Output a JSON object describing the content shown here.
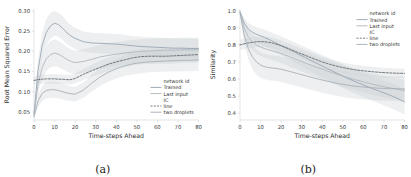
{
  "figure": {
    "panels": [
      {
        "caption": "(a)",
        "name": "panel-a",
        "chart_key": "rmse"
      },
      {
        "caption": "(b)",
        "name": "panel-b",
        "chart_key": "similarity"
      }
    ]
  },
  "legend": {
    "title": "network id",
    "items": [
      {
        "label": "Trained",
        "style": "solid",
        "color": "#9aa7b4"
      },
      {
        "label": "Last input",
        "style": "solid",
        "color": "#b0b8c0"
      },
      {
        "label": "IC",
        "style": "none",
        "color": "#b8bec4"
      },
      {
        "label": "line",
        "style": "dashed",
        "color": "#6f7478"
      },
      {
        "label": "two droplets",
        "style": "solid",
        "color": "#a8b0b8"
      }
    ]
  },
  "colors": {
    "band": "#c9cdd2",
    "band_light": "#dcdfe2",
    "axis": "#d8d8d8",
    "text": "#2f2f2f",
    "background": "#ffffff"
  },
  "chart_data": [
    {
      "key": "rmse",
      "type": "line",
      "title": "",
      "xlabel": "Time-steps Ahead",
      "ylabel": "Root Mean Squared Error",
      "xlim": [
        0,
        80
      ],
      "ylim": [
        0.03,
        0.305
      ],
      "xticks": [
        0,
        10,
        20,
        30,
        40,
        50,
        60,
        70,
        80
      ],
      "yticks": [
        0.05,
        0.1,
        0.15,
        0.2,
        0.25,
        0.3
      ],
      "ytick_labels": [
        "0.05",
        "0.10",
        "0.15",
        "0.20",
        "0.25",
        "0.30"
      ],
      "xtick_labels": [
        "0",
        "10",
        "20",
        "30",
        "40",
        "50",
        "60",
        "70",
        "80"
      ],
      "grid": false,
      "legend_position": "lower-right",
      "x": [
        0,
        2,
        4,
        6,
        8,
        10,
        12,
        14,
        16,
        18,
        20,
        24,
        28,
        32,
        36,
        40,
        44,
        48,
        52,
        56,
        60,
        64,
        68,
        72,
        76,
        80
      ],
      "series": [
        {
          "name": "Trained",
          "style": "solid",
          "values": [
            0.045,
            0.155,
            0.215,
            0.247,
            0.263,
            0.27,
            0.266,
            0.257,
            0.246,
            0.238,
            0.232,
            0.224,
            0.221,
            0.22,
            0.219,
            0.218,
            0.216,
            0.214,
            0.212,
            0.211,
            0.21,
            0.209,
            0.208,
            0.208,
            0.207,
            0.207
          ],
          "band_lower": [
            0.04,
            0.13,
            0.185,
            0.215,
            0.232,
            0.239,
            0.236,
            0.228,
            0.219,
            0.212,
            0.206,
            0.199,
            0.196,
            0.195,
            0.194,
            0.193,
            0.192,
            0.19,
            0.188,
            0.187,
            0.186,
            0.185,
            0.185,
            0.184,
            0.184,
            0.184
          ],
          "band_upper": [
            0.05,
            0.182,
            0.246,
            0.281,
            0.295,
            0.3,
            0.296,
            0.287,
            0.274,
            0.265,
            0.258,
            0.249,
            0.246,
            0.245,
            0.244,
            0.243,
            0.241,
            0.238,
            0.236,
            0.235,
            0.234,
            0.233,
            0.232,
            0.232,
            0.231,
            0.231
          ]
        },
        {
          "name": "Last input",
          "style": "solid",
          "values": [
            0.042,
            0.12,
            0.16,
            0.182,
            0.192,
            0.196,
            0.193,
            0.187,
            0.18,
            0.175,
            0.172,
            0.175,
            0.18,
            0.186,
            0.19,
            0.193,
            0.196,
            0.198,
            0.2,
            0.201,
            0.202,
            0.203,
            0.203,
            0.204,
            0.204,
            0.204
          ],
          "band_lower": [
            0.037,
            0.098,
            0.132,
            0.151,
            0.16,
            0.163,
            0.161,
            0.156,
            0.15,
            0.146,
            0.143,
            0.146,
            0.151,
            0.157,
            0.161,
            0.164,
            0.167,
            0.169,
            0.171,
            0.172,
            0.173,
            0.174,
            0.174,
            0.175,
            0.175,
            0.175
          ],
          "band_upper": [
            0.047,
            0.143,
            0.189,
            0.214,
            0.225,
            0.23,
            0.226,
            0.219,
            0.211,
            0.205,
            0.202,
            0.205,
            0.21,
            0.216,
            0.22,
            0.223,
            0.226,
            0.228,
            0.23,
            0.231,
            0.232,
            0.233,
            0.233,
            0.234,
            0.234,
            0.234
          ]
        },
        {
          "name": "line",
          "style": "dashed",
          "values": [
            0.128,
            0.13,
            0.131,
            0.132,
            0.132,
            0.132,
            0.131,
            0.131,
            0.13,
            0.13,
            0.133,
            0.143,
            0.152,
            0.16,
            0.168,
            0.174,
            0.179,
            0.184,
            0.187,
            0.188,
            0.188,
            0.188,
            0.189,
            0.19,
            0.191,
            0.192
          ],
          "band_lower": [
            0.118,
            0.119,
            0.12,
            0.12,
            0.12,
            0.12,
            0.119,
            0.119,
            0.118,
            0.118,
            0.121,
            0.129,
            0.137,
            0.144,
            0.151,
            0.157,
            0.161,
            0.165,
            0.168,
            0.169,
            0.169,
            0.169,
            0.17,
            0.171,
            0.172,
            0.173
          ],
          "band_upper": [
            0.138,
            0.141,
            0.142,
            0.143,
            0.144,
            0.144,
            0.143,
            0.143,
            0.142,
            0.142,
            0.145,
            0.157,
            0.167,
            0.176,
            0.185,
            0.191,
            0.197,
            0.203,
            0.206,
            0.207,
            0.207,
            0.207,
            0.208,
            0.209,
            0.21,
            0.211
          ]
        },
        {
          "name": "two droplets",
          "style": "solid",
          "values": [
            0.038,
            0.078,
            0.096,
            0.103,
            0.105,
            0.105,
            0.103,
            0.1,
            0.097,
            0.095,
            0.094,
            0.104,
            0.121,
            0.136,
            0.148,
            0.157,
            0.164,
            0.169,
            0.172,
            0.174,
            0.175,
            0.176,
            0.177,
            0.178,
            0.178,
            0.179
          ],
          "band_lower": [
            0.034,
            0.062,
            0.077,
            0.083,
            0.085,
            0.085,
            0.083,
            0.081,
            0.078,
            0.077,
            0.076,
            0.085,
            0.1,
            0.114,
            0.125,
            0.133,
            0.139,
            0.143,
            0.146,
            0.148,
            0.149,
            0.15,
            0.15,
            0.151,
            0.151,
            0.152
          ],
          "band_upper": [
            0.042,
            0.094,
            0.115,
            0.123,
            0.125,
            0.125,
            0.123,
            0.119,
            0.116,
            0.113,
            0.112,
            0.123,
            0.142,
            0.158,
            0.171,
            0.181,
            0.189,
            0.195,
            0.198,
            0.2,
            0.201,
            0.202,
            0.204,
            0.205,
            0.205,
            0.206
          ]
        }
      ]
    },
    {
      "key": "similarity",
      "type": "line",
      "title": "",
      "xlabel": "Time-steps Ahead",
      "ylabel": "Similarity",
      "xlim": [
        0,
        80
      ],
      "ylim": [
        0.36,
        1.01
      ],
      "xticks": [
        0,
        10,
        20,
        30,
        40,
        50,
        60,
        70,
        80
      ],
      "yticks": [
        0.4,
        0.5,
        0.6,
        0.7,
        0.8,
        0.9,
        1.0
      ],
      "ytick_labels": [
        "0.4",
        "0.5",
        "0.6",
        "0.7",
        "0.8",
        "0.9",
        "1.0"
      ],
      "xtick_labels": [
        "0",
        "10",
        "20",
        "30",
        "40",
        "50",
        "60",
        "70",
        "80"
      ],
      "grid": false,
      "legend_position": "upper-right",
      "x": [
        0,
        2,
        4,
        6,
        8,
        10,
        12,
        14,
        16,
        18,
        20,
        24,
        28,
        32,
        36,
        40,
        44,
        48,
        52,
        56,
        60,
        64,
        68,
        72,
        76,
        80
      ],
      "series": [
        {
          "name": "Trained",
          "style": "solid",
          "values": [
            0.995,
            0.93,
            0.893,
            0.874,
            0.862,
            0.853,
            0.843,
            0.832,
            0.82,
            0.808,
            0.796,
            0.772,
            0.748,
            0.724,
            0.7,
            0.676,
            0.652,
            0.629,
            0.606,
            0.585,
            0.565,
            0.546,
            0.528,
            0.51,
            0.49,
            0.466
          ],
          "band_lower": [
            0.985,
            0.9,
            0.855,
            0.832,
            0.817,
            0.806,
            0.794,
            0.781,
            0.767,
            0.753,
            0.74,
            0.713,
            0.687,
            0.661,
            0.635,
            0.609,
            0.584,
            0.56,
            0.536,
            0.514,
            0.493,
            0.474,
            0.455,
            0.436,
            0.415,
            0.391
          ],
          "band_upper": [
            1.0,
            0.958,
            0.928,
            0.913,
            0.903,
            0.896,
            0.888,
            0.879,
            0.869,
            0.859,
            0.849,
            0.828,
            0.806,
            0.784,
            0.762,
            0.74,
            0.718,
            0.696,
            0.675,
            0.655,
            0.636,
            0.618,
            0.6,
            0.583,
            0.564,
            0.54
          ]
        },
        {
          "name": "Last input",
          "style": "solid",
          "values": [
            0.992,
            0.9,
            0.848,
            0.818,
            0.799,
            0.787,
            0.778,
            0.771,
            0.764,
            0.757,
            0.75,
            0.731,
            0.712,
            0.693,
            0.675,
            0.658,
            0.641,
            0.625,
            0.61,
            0.596,
            0.583,
            0.571,
            0.56,
            0.55,
            0.541,
            0.532
          ],
          "band_lower": [
            0.98,
            0.862,
            0.802,
            0.769,
            0.748,
            0.735,
            0.725,
            0.717,
            0.709,
            0.702,
            0.694,
            0.674,
            0.654,
            0.634,
            0.615,
            0.597,
            0.58,
            0.564,
            0.548,
            0.534,
            0.521,
            0.509,
            0.498,
            0.488,
            0.479,
            0.47
          ],
          "band_upper": [
            1.0,
            0.936,
            0.891,
            0.864,
            0.847,
            0.836,
            0.828,
            0.822,
            0.816,
            0.81,
            0.804,
            0.786,
            0.768,
            0.751,
            0.734,
            0.718,
            0.702,
            0.687,
            0.673,
            0.659,
            0.646,
            0.634,
            0.623,
            0.613,
            0.604,
            0.595
          ]
        },
        {
          "name": "line",
          "style": "dashed",
          "values": [
            0.8,
            0.806,
            0.811,
            0.815,
            0.818,
            0.819,
            0.818,
            0.815,
            0.81,
            0.803,
            0.795,
            0.776,
            0.756,
            0.737,
            0.718,
            0.7,
            0.685,
            0.672,
            0.662,
            0.654,
            0.648,
            0.643,
            0.639,
            0.636,
            0.634,
            0.633
          ],
          "band_lower": [
            0.77,
            0.775,
            0.78,
            0.783,
            0.786,
            0.787,
            0.786,
            0.783,
            0.778,
            0.771,
            0.763,
            0.744,
            0.724,
            0.705,
            0.687,
            0.67,
            0.655,
            0.643,
            0.633,
            0.625,
            0.619,
            0.614,
            0.611,
            0.608,
            0.606,
            0.605
          ],
          "band_upper": [
            0.83,
            0.836,
            0.841,
            0.846,
            0.849,
            0.85,
            0.849,
            0.846,
            0.841,
            0.834,
            0.826,
            0.807,
            0.787,
            0.768,
            0.749,
            0.731,
            0.716,
            0.702,
            0.691,
            0.683,
            0.677,
            0.672,
            0.668,
            0.665,
            0.662,
            0.661
          ]
        },
        {
          "name": "two droplets",
          "style": "solid",
          "values": [
            0.988,
            0.858,
            0.78,
            0.73,
            0.7,
            0.682,
            0.672,
            0.667,
            0.664,
            0.661,
            0.657,
            0.645,
            0.632,
            0.619,
            0.606,
            0.594,
            0.583,
            0.573,
            0.565,
            0.558,
            0.553,
            0.549,
            0.546,
            0.544,
            0.543,
            0.542
          ],
          "band_lower": [
            0.975,
            0.81,
            0.716,
            0.659,
            0.627,
            0.608,
            0.598,
            0.593,
            0.59,
            0.587,
            0.583,
            0.57,
            0.557,
            0.544,
            0.531,
            0.519,
            0.508,
            0.499,
            0.491,
            0.485,
            0.48,
            0.477,
            0.474,
            0.472,
            0.471,
            0.47
          ],
          "band_upper": [
            1.0,
            0.906,
            0.844,
            0.801,
            0.773,
            0.756,
            0.746,
            0.741,
            0.738,
            0.735,
            0.731,
            0.72,
            0.707,
            0.694,
            0.681,
            0.669,
            0.658,
            0.647,
            0.639,
            0.631,
            0.626,
            0.621,
            0.618,
            0.616,
            0.615,
            0.614
          ]
        }
      ]
    }
  ]
}
